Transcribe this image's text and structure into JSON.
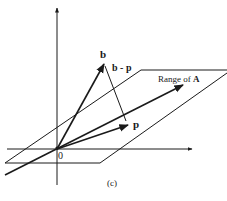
{
  "figure": {
    "caption": "(c)",
    "origin_label": "0",
    "vectors": {
      "b": {
        "label": "b",
        "tip": [
          104,
          63
        ]
      },
      "p": {
        "label": "p",
        "tip": [
          129,
          125
        ]
      },
      "b_minus_p": {
        "label": "b - p"
      }
    },
    "plane": {
      "label_prefix": "Range of ",
      "label_bold": "A"
    },
    "colors": {
      "ink": "#1a1a1a",
      "background": "#ffffff"
    }
  }
}
